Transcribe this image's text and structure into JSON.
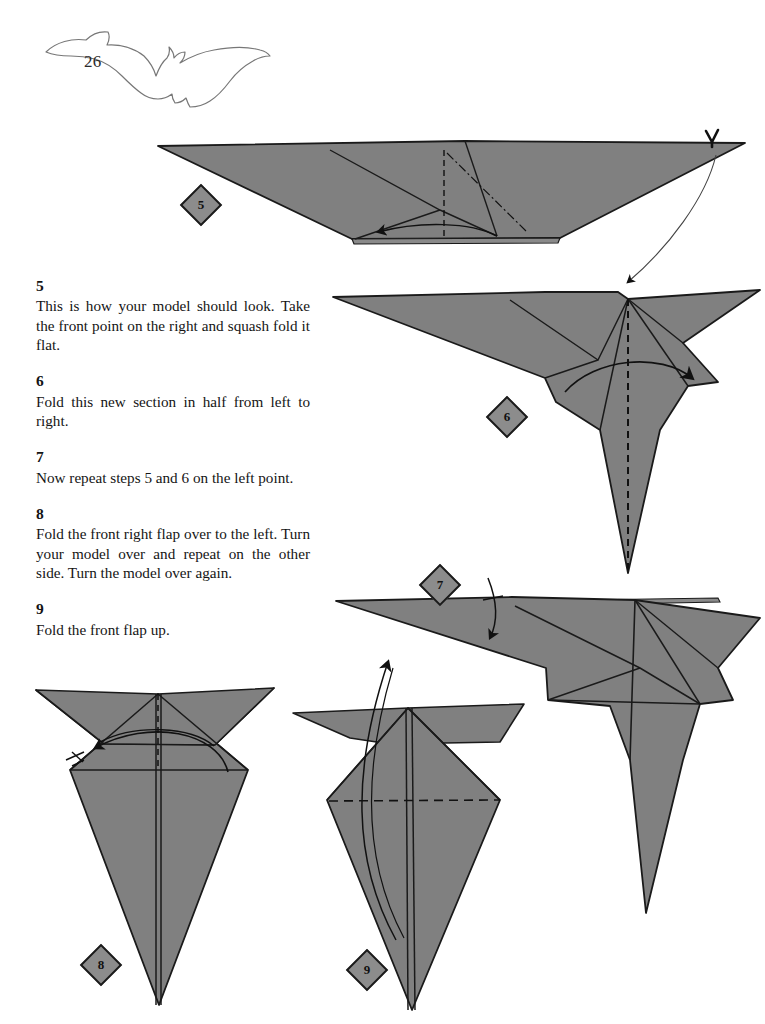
{
  "page": {
    "folio": "26",
    "emblem_icon": "bat-silhouette-icon",
    "background_color": "#ffffff",
    "paper_fill_color": "#808080",
    "paper_stroke_color": "#1a1a1a",
    "badge_fill_color": "#8c8c8c",
    "badge_stroke_color": "#1b1b1b",
    "text_color": "#141414"
  },
  "instructions": [
    {
      "number": "5",
      "text": "This is how your model should look. Take the front point on the right and squash fold it flat."
    },
    {
      "number": "6",
      "text": "Fold this new section in half from left to right."
    },
    {
      "number": "7",
      "text": "Now repeat steps 5 and 6 on the left point."
    },
    {
      "number": "8",
      "text": "Fold the front right flap over to the left. Turn your model over and repeat on the other side. Turn the model over again."
    },
    {
      "number": "9",
      "text": "Fold the front flap up."
    }
  ],
  "diagrams": [
    {
      "id": "diagram-5",
      "badge": "5",
      "caption_ref": "5",
      "description": "Wide flat folded model with shallow V top edge, dashed squash-fold creases near centre and a curved arrow at the base.",
      "marks": [
        "dashed-crease",
        "dash-dot-crease",
        "curved-fold-arrow",
        "squash-fold-arrowhead"
      ]
    },
    {
      "id": "diagram-6",
      "badge": "6",
      "caption_ref": "6",
      "description": "Bird-like form with long left wing, small right spike and a long lower point; vertical dashed centre crease with curved arrow folding left half to the right.",
      "marks": [
        "vertical-dashed-crease",
        "curved-fold-arrow"
      ]
    },
    {
      "id": "diagram-7",
      "badge": "7",
      "caption_ref": "7",
      "description": "Mirrored form after step 6, with a short hooked repeat arrow carrying a single tick mark indicating the steps are repeated on the left point.",
      "marks": [
        "repeat-arrow",
        "repeat-tick"
      ]
    },
    {
      "id": "diagram-8",
      "badge": "8",
      "caption_ref": "8",
      "description": "Symmetrical kite/dart with two upper wings and a long lower point; vertical dashed centre crease and a curved arrow sweeping the front right flap over to the left, with a repeat tick.",
      "marks": [
        "vertical-dashed-crease",
        "curved-fold-arrow",
        "repeat-tick"
      ]
    },
    {
      "id": "diagram-9",
      "badge": "9",
      "caption_ref": "9",
      "description": "Narrow kite with upper wings and a horizontal dashed crease across the middle; a long curved arrow sweeps upward to fold the front flap up.",
      "marks": [
        "horizontal-dashed-crease",
        "long-curved-fold-arrow"
      ]
    }
  ]
}
